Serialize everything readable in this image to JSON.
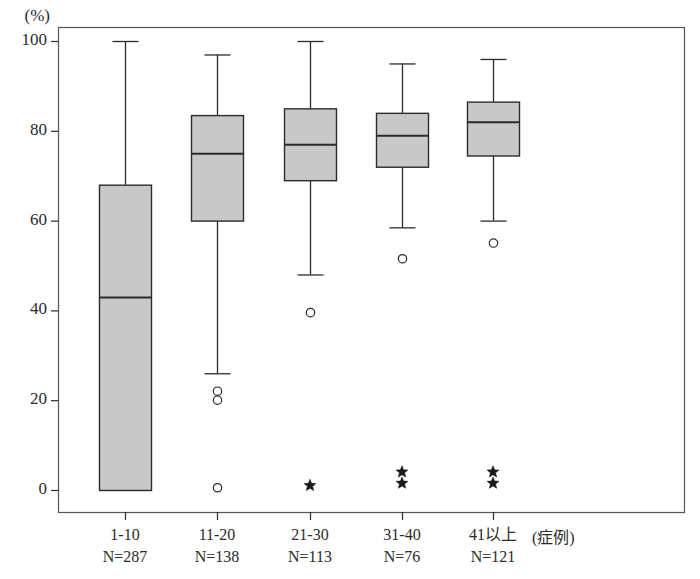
{
  "chart_data": {
    "type": "box",
    "title": "",
    "subtitle": "",
    "xlabel": "(症例)",
    "ylabel": "(%)",
    "ylim": [
      0,
      100
    ],
    "yticks": [
      0,
      20,
      40,
      60,
      80,
      100
    ],
    "ytick_labels": [
      "0",
      "20",
      "40",
      "60",
      "80",
      "100"
    ],
    "grid": false,
    "legend": "none",
    "categories": [
      "1-10",
      "11-20",
      "21-30",
      "31-40",
      "41以上"
    ],
    "category_counts": [
      "N=287",
      "N=138",
      "N=113",
      "N=76",
      "N=121"
    ],
    "boxes": [
      {
        "category": "1-10",
        "count": "N=287",
        "whisker_low": 0,
        "q1": 0,
        "median": 43,
        "q3": 68,
        "whisker_high": 100,
        "outliers_circle": [],
        "outliers_star": []
      },
      {
        "category": "11-20",
        "count": "N=138",
        "whisker_low": 26,
        "q1": 60,
        "median": 75,
        "q3": 83.5,
        "whisker_high": 97,
        "outliers_circle": [
          22,
          20,
          0.5
        ],
        "outliers_star": []
      },
      {
        "category": "21-30",
        "count": "N=113",
        "whisker_low": 48,
        "q1": 69,
        "median": 77,
        "q3": 85,
        "whisker_high": 100,
        "outliers_circle": [
          39.5
        ],
        "outliers_star": [
          1
        ]
      },
      {
        "category": "31-40",
        "count": "N=76",
        "whisker_low": 58.5,
        "q1": 72,
        "median": 79,
        "q3": 84,
        "whisker_high": 95,
        "outliers_circle": [
          51.5
        ],
        "outliers_star": [
          4,
          1.5
        ]
      },
      {
        "category": "41以上",
        "count": "N=121",
        "whisker_low": 60,
        "q1": 74.5,
        "median": 82,
        "q3": 86.5,
        "whisker_high": 96,
        "outliers_circle": [
          55
        ],
        "outliers_star": [
          4,
          1.5
        ]
      }
    ],
    "colors": {
      "box_fill": "#c8c8c8",
      "line": "#2b2b2b",
      "frame": "#555555",
      "text": "#2b2b2b"
    }
  },
  "plot_geometry": {
    "frame_left": 58,
    "frame_right": 684,
    "frame_top": 27,
    "frame_bottom": 512,
    "y_zero_px": 490,
    "y_hundred_px": 41,
    "box_centers_px": [
      125,
      217,
      310,
      402,
      493
    ],
    "box_half_width_px": 26
  }
}
